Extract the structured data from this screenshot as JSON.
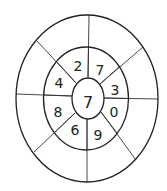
{
  "diagram": {
    "type": "concentric-ellipse-number-puzzle",
    "center": {
      "value": "7"
    },
    "ring_numbers": [
      {
        "position": "top-left",
        "value": "2"
      },
      {
        "position": "top-right",
        "value": "7"
      },
      {
        "position": "right-upper",
        "value": "3"
      },
      {
        "position": "right-lower",
        "value": "0"
      },
      {
        "position": "bottom-right",
        "value": "9"
      },
      {
        "position": "bottom-left",
        "value": "6"
      },
      {
        "position": "left-lower",
        "value": "8"
      },
      {
        "position": "left-upper",
        "value": "4"
      }
    ],
    "outer_ring_segments": 8,
    "outer_ring_values": []
  }
}
